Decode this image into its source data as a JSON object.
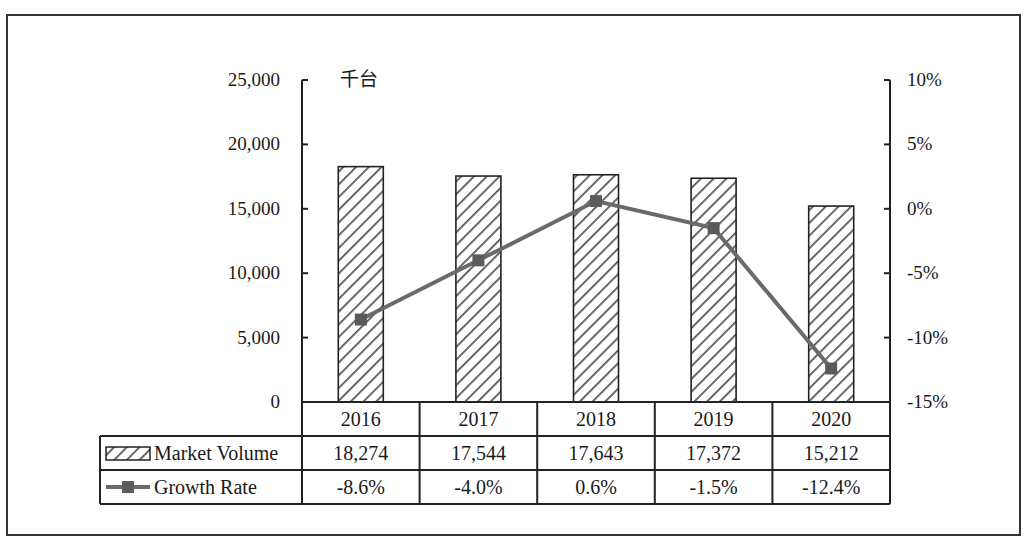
{
  "chart_data": {
    "type": "bar",
    "title": "",
    "unit_label": "千台",
    "categories": [
      "2016",
      "2017",
      "2018",
      "2019",
      "2020"
    ],
    "series": [
      {
        "name": "Market Volume",
        "kind": "bar",
        "axis": "left",
        "pattern": "diagonal-hatch",
        "values": [
          18274,
          17544,
          17643,
          17372,
          15212
        ],
        "labels": [
          "18,274",
          "17,544",
          "17,643",
          "17,372",
          "15,212"
        ]
      },
      {
        "name": "Growth Rate",
        "kind": "line",
        "axis": "right",
        "marker": "square",
        "color": "#666666",
        "values": [
          -8.6,
          -4.0,
          0.6,
          -1.5,
          -12.4
        ],
        "labels": [
          "-8.6%",
          "-4.0%",
          "0.6%",
          "-1.5%",
          "-12.4%"
        ]
      }
    ],
    "left_axis": {
      "ylim": [
        0,
        25000
      ],
      "ticks": [
        "0",
        "5,000",
        "10,000",
        "15,000",
        "20,000",
        "25,000"
      ]
    },
    "right_axis": {
      "ylim": [
        -15,
        10
      ],
      "ticks": [
        "-15%",
        "-10%",
        "-5%",
        "0%",
        "5%",
        "10%"
      ]
    },
    "legend_position": "data-table",
    "grid": false,
    "data_table": true
  }
}
